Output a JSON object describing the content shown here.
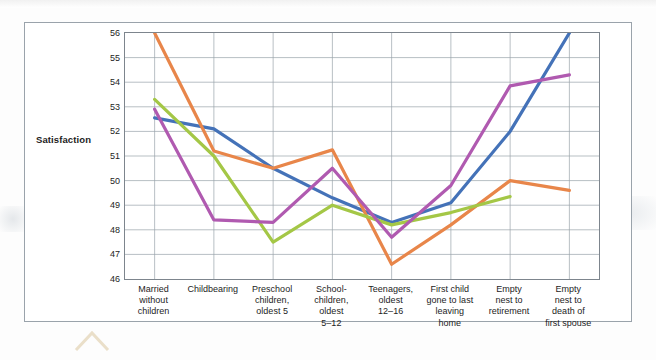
{
  "figure": {
    "y_axis_title": "Satisfaction"
  },
  "chart_data": {
    "type": "line",
    "title": "",
    "xlabel": "",
    "ylabel": "Satisfaction",
    "ylim": [
      46,
      56
    ],
    "y_ticks": [
      56,
      55,
      54,
      53,
      52,
      51,
      50,
      49,
      48,
      47,
      46
    ],
    "grid": true,
    "legend": "none",
    "categories": [
      "Married without children",
      "Childbearing",
      "Preschool children, oldest 5",
      "School-children, oldest 5–12",
      "Teenagers, oldest 12–16",
      "First child gone to last leaving home",
      "Empty nest to retirement",
      "Empty nest to death of first spouse"
    ],
    "category_label_lines": [
      [
        "Married",
        "without",
        "children"
      ],
      [
        "Childbearing"
      ],
      [
        "Preschool",
        "children,",
        "oldest 5"
      ],
      [
        "School-",
        "children,",
        "oldest",
        "5–12"
      ],
      [
        "Teenagers,",
        "oldest",
        "12–16"
      ],
      [
        "First child",
        "gone to last",
        "leaving",
        "home"
      ],
      [
        "Empty",
        "nest to",
        "retirement"
      ],
      [
        "Empty",
        "nest to",
        "death of",
        "first spouse"
      ]
    ],
    "series": [
      {
        "name": "series-blue",
        "color": "#4472b8",
        "values": [
          52.55,
          52.1,
          50.5,
          49.3,
          48.3,
          49.1,
          52.0,
          56.0
        ]
      },
      {
        "name": "series-orange",
        "color": "#e8864a",
        "values": [
          56.0,
          51.2,
          50.5,
          51.25,
          46.6,
          48.2,
          50.0,
          49.6
        ]
      },
      {
        "name": "series-green",
        "color": "#a4c746",
        "values": [
          53.3,
          51.0,
          47.5,
          49.0,
          48.2,
          48.7,
          49.35,
          null
        ]
      },
      {
        "name": "series-purple",
        "color": "#b05ab0",
        "values": [
          52.9,
          48.4,
          48.3,
          50.5,
          47.7,
          49.8,
          53.85,
          54.3
        ]
      }
    ]
  }
}
